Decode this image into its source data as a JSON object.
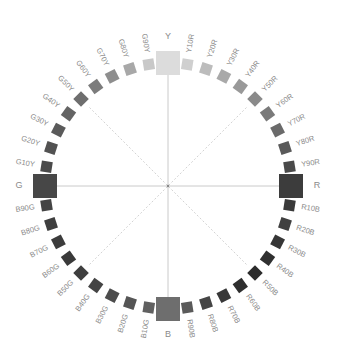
{
  "diagram": {
    "center": [
      168,
      186
    ],
    "radius": 123,
    "label_radius": 146,
    "primaries": [
      {
        "label": "Y",
        "angle": 0,
        "color": "#dcdcdc"
      },
      {
        "label": "R",
        "angle": 90,
        "color": "#3c3c3c"
      },
      {
        "label": "B",
        "angle": 180,
        "color": "#6e6e6e"
      },
      {
        "label": "G",
        "angle": 270,
        "color": "#474747"
      }
    ],
    "hues": [
      {
        "label": "Y10R",
        "angle": 9,
        "color": "#cfcfcf"
      },
      {
        "label": "Y20R",
        "angle": 18,
        "color": "#bcbcbc"
      },
      {
        "label": "Y30R",
        "angle": 27,
        "color": "#a9a9a9"
      },
      {
        "label": "Y40R",
        "angle": 36,
        "color": "#999999"
      },
      {
        "label": "Y50R",
        "angle": 45,
        "color": "#8a8a8a"
      },
      {
        "label": "Y60R",
        "angle": 54,
        "color": "#7a7a7a"
      },
      {
        "label": "Y70R",
        "angle": 63,
        "color": "#6a6a6a"
      },
      {
        "label": "Y80R",
        "angle": 72,
        "color": "#5a5a5a"
      },
      {
        "label": "Y90R",
        "angle": 81,
        "color": "#4a4a4a"
      },
      {
        "label": "R10B",
        "angle": 99,
        "color": "#3a3a3a"
      },
      {
        "label": "R20B",
        "angle": 108,
        "color": "#404040"
      },
      {
        "label": "R30B",
        "angle": 117,
        "color": "#363636"
      },
      {
        "label": "R40B",
        "angle": 126,
        "color": "#303030"
      },
      {
        "label": "R50B",
        "angle": 135,
        "color": "#2c2c2c"
      },
      {
        "label": "R60B",
        "angle": 144,
        "color": "#2e2e2e"
      },
      {
        "label": "R70B",
        "angle": 153,
        "color": "#383838"
      },
      {
        "label": "R80B",
        "angle": 162,
        "color": "#454545"
      },
      {
        "label": "R90B",
        "angle": 171,
        "color": "#5a5a5a"
      },
      {
        "label": "B10G",
        "angle": 189,
        "color": "#606060"
      },
      {
        "label": "B20G",
        "angle": 198,
        "color": "#555555"
      },
      {
        "label": "B30G",
        "angle": 207,
        "color": "#4c4c4c"
      },
      {
        "label": "B40G",
        "angle": 216,
        "color": "#444444"
      },
      {
        "label": "B50G",
        "angle": 225,
        "color": "#3e3e3e"
      },
      {
        "label": "B60G",
        "angle": 234,
        "color": "#3a3a3a"
      },
      {
        "label": "B70G",
        "angle": 243,
        "color": "#3c3c3c"
      },
      {
        "label": "B80G",
        "angle": 252,
        "color": "#3f3f3f"
      },
      {
        "label": "B90G",
        "angle": 261,
        "color": "#444444"
      },
      {
        "label": "G10Y",
        "angle": 279,
        "color": "#4a4a4a"
      },
      {
        "label": "G20Y",
        "angle": 288,
        "color": "#525252"
      },
      {
        "label": "G30Y",
        "angle": 297,
        "color": "#5a5a5a"
      },
      {
        "label": "G40Y",
        "angle": 306,
        "color": "#646464"
      },
      {
        "label": "G50Y",
        "angle": 315,
        "color": "#6e6e6e"
      },
      {
        "label": "G60Y",
        "angle": 324,
        "color": "#7c7c7c"
      },
      {
        "label": "G70Y",
        "angle": 333,
        "color": "#8e8e8e"
      },
      {
        "label": "G80Y",
        "angle": 342,
        "color": "#a8a8a8"
      },
      {
        "label": "G90Y",
        "angle": 351,
        "color": "#c8c8c8"
      }
    ],
    "label_color": "#8a8a8a",
    "axis_color": "#bdbdbd",
    "diagonal_color": "#c8c8c8"
  }
}
